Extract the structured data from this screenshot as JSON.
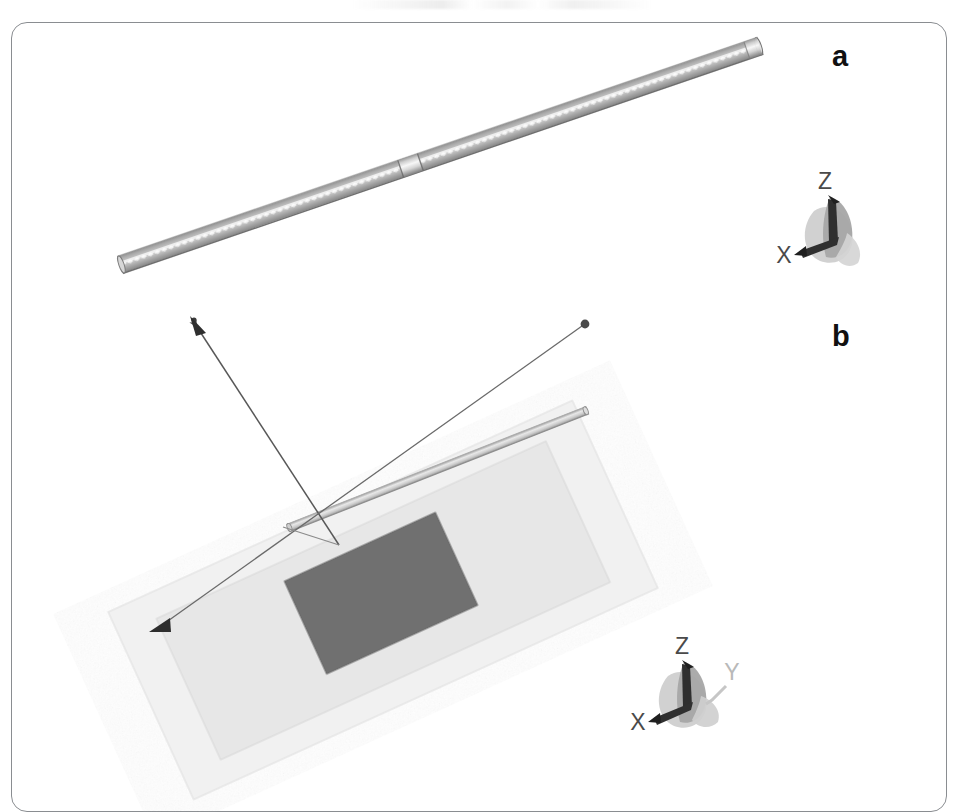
{
  "figure": {
    "kind": "cad-render-figure",
    "background_color": "#ffffff",
    "frame": {
      "border_color": "#8a8d91",
      "corner_radius_px": 16
    },
    "panels": [
      {
        "id": "a",
        "letter": "a",
        "letter_color": "#111111",
        "description": "threaded rod / screw shown in isometric view",
        "axis_gizmo": {
          "name": "coordinate-triad-a",
          "labels": [
            "X",
            "Z"
          ],
          "label_color": "#4a4a4a",
          "hidden_axis": "Y",
          "body_colors": [
            "#c9c9c9",
            "#a8a8a8",
            "#d6d6d6",
            "#3a3a3a"
          ]
        },
        "objects": [
          {
            "name": "threaded-rod",
            "kind": "threaded-rod",
            "colors": {
              "body_light": "#f2f2f2",
              "body_mid": "#b5b5b5",
              "body_dark": "#6f6f6f",
              "thread_edge": "#8d8d8d"
            },
            "has_mid_joint": true
          }
        ]
      },
      {
        "id": "b",
        "letter": "b",
        "letter_color": "#111111",
        "description": "rectangular plate assembly with thin rod and dimension leader",
        "axis_gizmo": {
          "name": "coordinate-triad-b",
          "labels": [
            "X",
            "Y",
            "Z"
          ],
          "label_color": "#4a4a4a",
          "dim_label": "Y",
          "dim_label_color": "#b9b9b9",
          "body_colors": [
            "#c9c9c9",
            "#a8a8a8",
            "#d6d6d6",
            "#3a3a3a"
          ]
        },
        "objects": [
          {
            "name": "outer-plate",
            "kind": "rectangular-plate",
            "fill": "#f0f0f0",
            "edge": "#e2e2e2"
          },
          {
            "name": "inner-plate",
            "kind": "rectangular-plate",
            "fill": "#e6e6e6",
            "edge": "#dcdcdc"
          },
          {
            "name": "center-patch",
            "kind": "rectangular-patch",
            "fill": "#707070",
            "edge": "#6a6a6a"
          },
          {
            "name": "thin-rod",
            "kind": "slender-bar",
            "fill": "#d2d2d2",
            "edge": "#9a9a9a"
          },
          {
            "name": "dimension-leader",
            "kind": "dimension-line",
            "color": "#5d5d5d",
            "endpoints": [
              "arrow",
              "dot"
            ]
          },
          {
            "name": "dimension-leader-secondary",
            "kind": "dimension-line",
            "color": "#5d5d5d",
            "endpoints": [
              "arrow",
              "dot"
            ]
          }
        ]
      }
    ]
  },
  "labels": {
    "panel_a": "a",
    "panel_b": "b",
    "axis_x": "X",
    "axis_y": "Y",
    "axis_z": "Z"
  }
}
